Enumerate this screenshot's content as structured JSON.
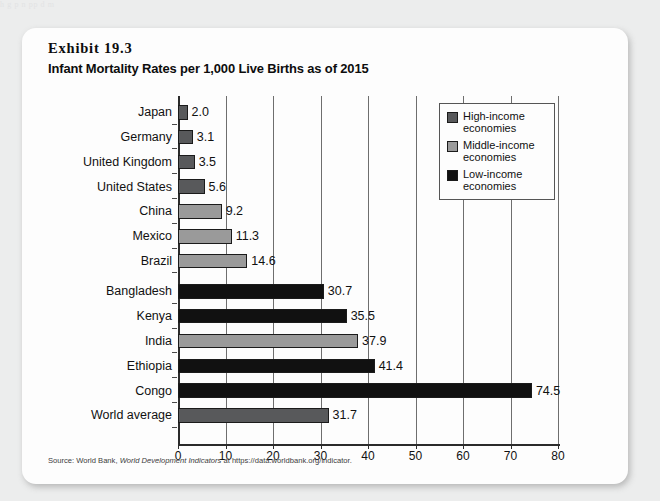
{
  "page": {
    "bleed_text": "h  g  p     n  pp                        d                  m"
  },
  "exhibit": {
    "number": "Exhibit 19.3",
    "title": "Infant Mortality Rates per 1,000 Live Births as of 2015",
    "source_prefix": "Source: World Bank, ",
    "source_italic": "World Development Indicators",
    "source_suffix": " at https://data.worldbank.org/indicator."
  },
  "legend": {
    "items": [
      {
        "label": "High-income economies",
        "color": "#58595b"
      },
      {
        "label": "Middle-income economies",
        "color": "#9a9a9a"
      },
      {
        "label": "Low-income economies",
        "color": "#111111"
      }
    ]
  },
  "colors": {
    "high_income": "#58595b",
    "middle_income": "#9a9a9a",
    "low_income": "#111111",
    "world_average": "#58595b",
    "card_bg": "#fdfdfd",
    "page_bg": "#eceded",
    "gridline": "#6e6e6e",
    "axis": "#2b2b2b"
  },
  "chart_data": {
    "type": "bar",
    "orientation": "horizontal",
    "title": "Infant Mortality Rates per 1,000 Live Births as of 2015",
    "xlabel": "",
    "ylabel": "",
    "xlim": [
      0,
      80
    ],
    "xticks": [
      0,
      10,
      20,
      30,
      40,
      50,
      60,
      70,
      80
    ],
    "grid": "vertical",
    "legend_position": "right-top",
    "categories": [
      "Japan",
      "Germany",
      "United Kingdom",
      "United States",
      "China",
      "Mexico",
      "Brazil",
      "Bangladesh",
      "Kenya",
      "India",
      "Ethiopia",
      "Congo",
      "World average"
    ],
    "values": [
      2.0,
      3.1,
      3.5,
      5.6,
      9.2,
      11.3,
      14.6,
      30.7,
      35.5,
      37.9,
      41.4,
      74.5,
      31.7
    ],
    "value_labels": [
      "2.0",
      "3.1",
      "3.5",
      "5.6",
      "9.2",
      "11.3",
      "14.6",
      "30.7",
      "35.5",
      "37.9",
      "41.4",
      "74.5",
      "31.7"
    ],
    "groups": [
      "high_income",
      "high_income",
      "high_income",
      "high_income",
      "middle_income",
      "middle_income",
      "middle_income",
      "low_income",
      "low_income",
      "middle_income",
      "low_income",
      "low_income",
      "world_average"
    ]
  }
}
